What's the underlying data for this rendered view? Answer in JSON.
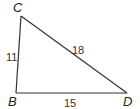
{
  "diagram": {
    "type": "triangle",
    "vertices": [
      {
        "name": "C",
        "x": 21,
        "y": 16,
        "label_x": 13,
        "label_y": 12
      },
      {
        "name": "B",
        "x": 16,
        "y": 93,
        "label_x": 8,
        "label_y": 106
      },
      {
        "name": "D",
        "x": 127,
        "y": 93,
        "label_x": 123,
        "label_y": 106
      }
    ],
    "sides": [
      {
        "from": "C",
        "to": "B",
        "length": "11",
        "label_x": 6,
        "label_y": 61
      },
      {
        "from": "C",
        "to": "D",
        "length": "18",
        "label_x": 72,
        "label_y": 54
      },
      {
        "from": "B",
        "to": "D",
        "length": "15",
        "label_x": 64,
        "label_y": 107
      }
    ],
    "colors": {
      "stroke": "#333333",
      "background": "#ffffff"
    }
  }
}
